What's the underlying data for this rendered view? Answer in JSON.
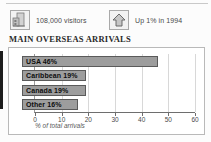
{
  "header": {
    "stats": [
      {
        "icon": "buildings-icon",
        "label": "108,000 visitors"
      },
      {
        "icon": "up-arrow-icon",
        "label": "Up 1% in 1994"
      }
    ]
  },
  "section": {
    "title": "MAIN OVERSEAS ARRIVALS"
  },
  "chart_data": {
    "type": "bar",
    "orientation": "horizontal",
    "title": "MAIN OVERSEAS ARRIVALS",
    "categories": [
      "USA",
      "Caribbean",
      "Canada",
      "Other"
    ],
    "values": [
      46,
      19,
      19,
      16
    ],
    "bar_labels": [
      "USA 46%",
      "Caribbean 19%",
      "Canada 19%",
      "Other 16%"
    ],
    "xlabel": "% of total arrivals",
    "ylabel": "",
    "xlim": [
      0,
      60
    ],
    "xticks": [
      0,
      10,
      20,
      30,
      40,
      50,
      60
    ],
    "xtick_labels": [
      "0",
      "10",
      "20",
      "30",
      "40",
      "50",
      "60"
    ],
    "grid": true,
    "legend": false,
    "colors": {
      "bar_fill": "#9d9d9d",
      "bar_border": "#5a5a5a",
      "label_text": "#0d0d0d",
      "axis": "#6e6e6e",
      "grid": "#d8d8d8"
    }
  }
}
